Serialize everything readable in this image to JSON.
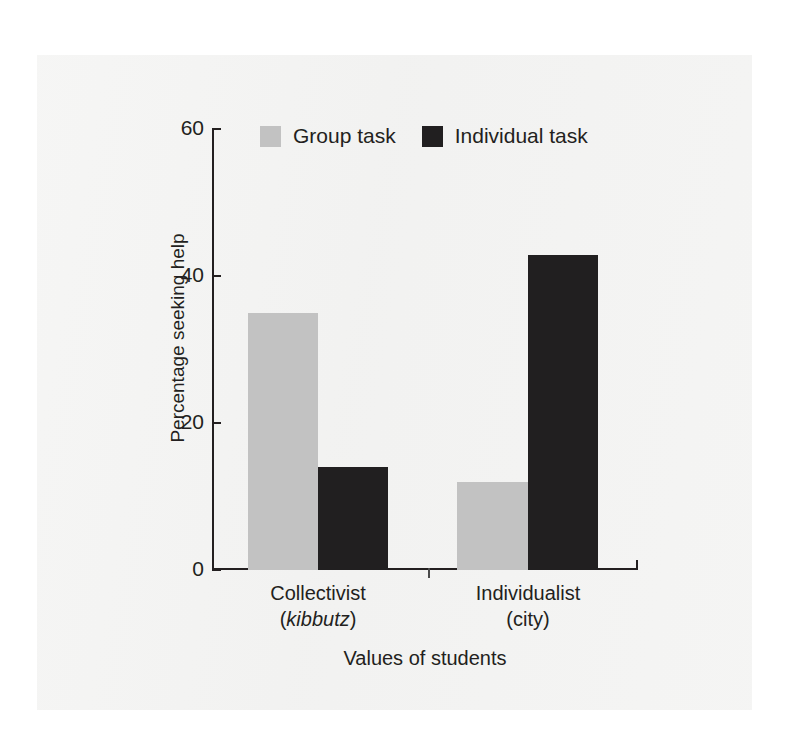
{
  "figure": {
    "y_axis_title": "Percentage seeking help",
    "x_axis_title": "Values of students",
    "y_ticks": [
      "0",
      "20",
      "40",
      "60"
    ],
    "categories": [
      {
        "line1": "Collectivist",
        "line2_prefix": "(",
        "line2_italic": "kibbutz",
        "line2_suffix": ")"
      },
      {
        "line1": "Individualist",
        "line2_prefix": "(",
        "line2_italic": "",
        "line2_suffix": "city)"
      }
    ],
    "legend": [
      {
        "label": "Group task",
        "color": "#c2c2c2"
      },
      {
        "label": "Individual task",
        "color": "#211f20"
      }
    ]
  },
  "chart_data": {
    "type": "bar",
    "title": "",
    "xlabel": "Values of students",
    "ylabel": "Percentage seeking help",
    "categories": [
      "Collectivist (kibbutz)",
      "Individualist (city)"
    ],
    "series": [
      {
        "name": "Group task",
        "color": "#c2c2c2",
        "values": [
          35,
          12
        ]
      },
      {
        "name": "Individual task",
        "color": "#211f20",
        "values": [
          14,
          43
        ]
      }
    ],
    "ylim": [
      0,
      60
    ],
    "yticks": [
      0,
      20,
      40,
      60
    ],
    "grid": false,
    "legend_position": "top"
  }
}
